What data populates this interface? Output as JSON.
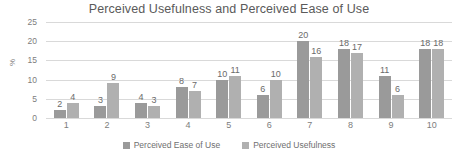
{
  "chart_data": {
    "type": "bar",
    "title": "Perceived Usefulness and Perceived Ease of Use",
    "xlabel": "",
    "ylabel": "%",
    "ylim": [
      0,
      25
    ],
    "ytick_labels": [
      "0",
      "5",
      "10",
      "15",
      "20",
      "25"
    ],
    "yticks": [
      0,
      5,
      10,
      15,
      20,
      25
    ],
    "grid": true,
    "legend_position": "bottom",
    "categories": [
      "1",
      "2",
      "3",
      "4",
      "5",
      "6",
      "7",
      "8",
      "9",
      "10"
    ],
    "series": [
      {
        "name": "Perceived Ease of Use",
        "color": "#9a9a9a",
        "values": [
          2,
          3,
          4,
          8,
          10,
          6,
          20,
          18,
          11,
          18
        ]
      },
      {
        "name": "Perceived Usefulness",
        "color": "#b0b0b0",
        "values": [
          4,
          9,
          3,
          7,
          11,
          10,
          16,
          17,
          6,
          18
        ]
      }
    ]
  }
}
